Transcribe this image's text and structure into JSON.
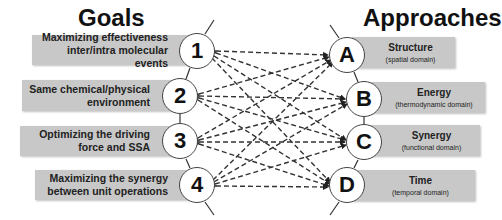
{
  "headings": {
    "goals": "Goals",
    "approaches": "Approaches"
  },
  "goals": [
    {
      "id": "1",
      "line1": "Maximizing effectiveness",
      "line2": "inter/intra molecular events"
    },
    {
      "id": "2",
      "line1": "Same chemical/physical",
      "line2": "environment"
    },
    {
      "id": "3",
      "line1": "Optimizing the driving",
      "line2": "force and SSA"
    },
    {
      "id": "4",
      "line1": "Maximizing the synergy",
      "line2": "between unit operations"
    }
  ],
  "approaches": [
    {
      "id": "A",
      "title": "Structure",
      "subtitle": "(spatial domain)"
    },
    {
      "id": "B",
      "title": "Energy",
      "subtitle": "(thermodynamic domain)"
    },
    {
      "id": "C",
      "title": "Synergy",
      "subtitle": "(functional domain)"
    },
    {
      "id": "D",
      "title": "Time",
      "subtitle": "(temporal domain)"
    }
  ],
  "connections": "every goal (1-4) connected to every approach (A-D) with bidirectional dashed arrows",
  "colors": {
    "box_fill": "#c8c8c8",
    "line": "#333333",
    "node_fill": "#ffffff"
  }
}
